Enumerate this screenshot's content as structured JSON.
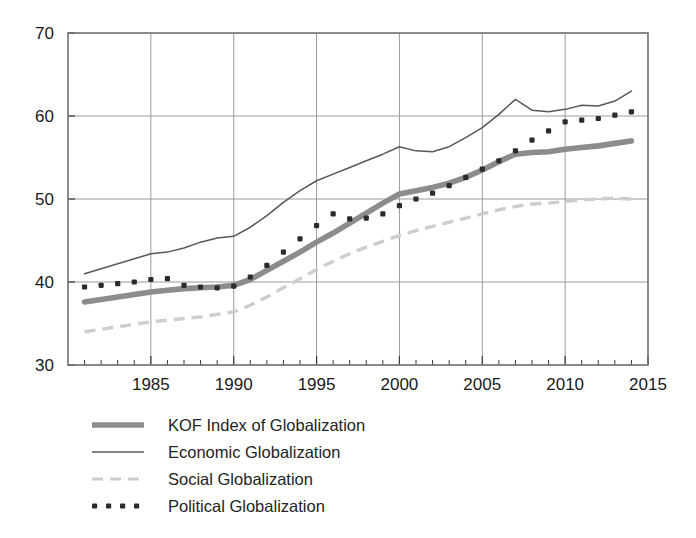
{
  "chart_data": {
    "type": "line",
    "title": "",
    "subtitle": "",
    "xlabel": "",
    "ylabel": "",
    "xlim": [
      1980,
      2015
    ],
    "ylim": [
      30,
      70
    ],
    "yticks": [
      30,
      40,
      50,
      60,
      70
    ],
    "xticks": [
      1985,
      1990,
      1995,
      2000,
      2005,
      2010,
      2015
    ],
    "xticks_minor_step": 1,
    "grid": true,
    "grid_color": "#9a9a9a",
    "legend_position": "below",
    "x": [
      1981,
      1982,
      1983,
      1984,
      1985,
      1986,
      1987,
      1988,
      1989,
      1990,
      1991,
      1992,
      1993,
      1994,
      1995,
      1996,
      1997,
      1998,
      1999,
      2000,
      2001,
      2002,
      2003,
      2004,
      2005,
      2006,
      2007,
      2008,
      2009,
      2010,
      2011,
      2012,
      2013,
      2014
    ],
    "series": [
      {
        "name": "KOF Index of Globalization",
        "style": "thick-solid",
        "color": "#8c8c8c",
        "values": [
          37.6,
          37.9,
          38.2,
          38.5,
          38.8,
          39.0,
          39.2,
          39.3,
          39.4,
          39.6,
          40.3,
          41.4,
          42.5,
          43.6,
          44.8,
          45.9,
          47.1,
          48.3,
          49.5,
          50.6,
          51.0,
          51.4,
          51.9,
          52.6,
          53.5,
          54.5,
          55.4,
          55.6,
          55.7,
          56.0,
          56.2,
          56.4,
          56.7,
          57.0
        ]
      },
      {
        "name": "Economic Globalization",
        "style": "thin-solid",
        "color": "#585858",
        "values": [
          41.0,
          41.6,
          42.2,
          42.8,
          43.4,
          43.6,
          44.1,
          44.8,
          45.3,
          45.5,
          46.6,
          48.0,
          49.6,
          51.0,
          52.2,
          53.0,
          53.8,
          54.6,
          55.4,
          56.3,
          55.8,
          55.7,
          56.3,
          57.4,
          58.6,
          60.2,
          62.0,
          60.7,
          60.5,
          60.8,
          61.3,
          61.2,
          61.8,
          63.0
        ]
      },
      {
        "name": "Social Globalization",
        "style": "dashed",
        "color": "#cdcdcd",
        "values": [
          34.0,
          34.3,
          34.6,
          34.9,
          35.2,
          35.4,
          35.6,
          35.8,
          36.1,
          36.4,
          37.2,
          38.2,
          39.3,
          40.4,
          41.5,
          42.5,
          43.4,
          44.2,
          44.9,
          45.6,
          46.2,
          46.7,
          47.2,
          47.7,
          48.2,
          48.7,
          49.1,
          49.4,
          49.5,
          49.7,
          49.9,
          50.0,
          50.1,
          50.0
        ]
      },
      {
        "name": "Political Globalization",
        "style": "dotted",
        "color": "#2b2b2b",
        "values": [
          39.4,
          39.6,
          39.8,
          40.0,
          40.3,
          40.4,
          39.6,
          39.4,
          39.3,
          39.5,
          40.6,
          42.0,
          43.6,
          45.2,
          46.8,
          48.2,
          47.6,
          47.7,
          48.2,
          49.2,
          50.0,
          50.7,
          51.6,
          52.6,
          53.6,
          54.6,
          55.8,
          57.1,
          58.2,
          59.3,
          59.5,
          59.7,
          60.1,
          60.5
        ]
      }
    ]
  },
  "legend": {
    "items": [
      {
        "label": "KOF Index of Globalization",
        "swatch": "thick-solid-swatch"
      },
      {
        "label": "Economic Globalization",
        "swatch": "thin-solid-swatch"
      },
      {
        "label": "Social Globalization",
        "swatch": "dashed-swatch"
      },
      {
        "label": "Political Globalization",
        "swatch": "dotted-swatch"
      }
    ]
  },
  "axis": {
    "y_labels": [
      "70",
      "60",
      "50",
      "40",
      "30"
    ],
    "x_labels": [
      "1985",
      "1990",
      "1995",
      "2000",
      "2005",
      "2010",
      "2015"
    ]
  }
}
